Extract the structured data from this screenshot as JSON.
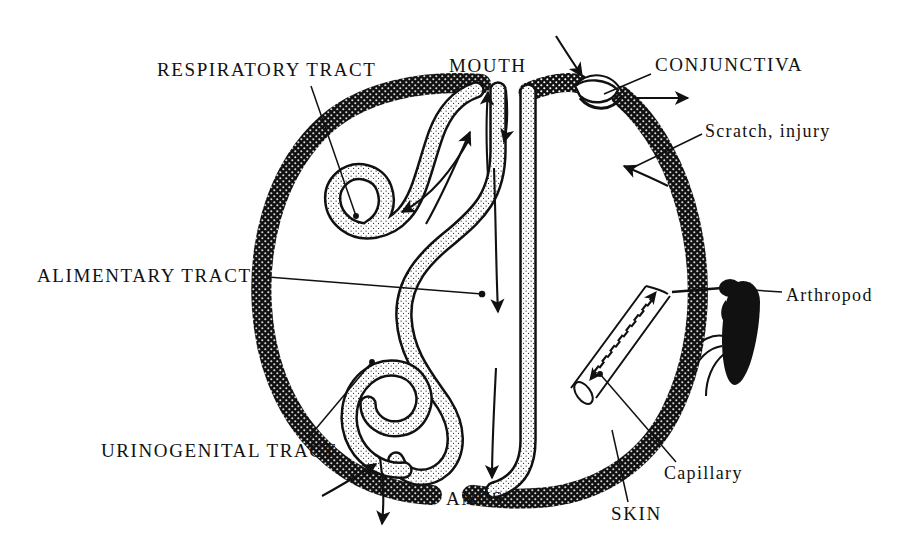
{
  "figure": {
    "kind": "anatomical-schematic",
    "background_color": "#ffffff",
    "ink_color": "#111111"
  },
  "labels": {
    "respiratory_tract": "RESPIRATORY TRACT",
    "mouth": "MOUTH",
    "conjunctiva": "CONJUNCTIVA",
    "scratch_injury": "Scratch, injury",
    "alimentary_tract": "ALIMENTARY TRACT",
    "arthropod": "Arthropod",
    "urinogenital_tract": "URINOGENITAL TRACT",
    "capillary": "Capillary",
    "anus": "ANUS",
    "skin": "SKIN"
  },
  "structures": [
    {
      "name": "skin-boundary",
      "style": "thick stippled black band forming closed body outline"
    },
    {
      "name": "respiratory-tract",
      "style": "stippled tube, upper left, looping inward from mouth"
    },
    {
      "name": "alimentary-tract",
      "style": "stippled tube running mouth to anus"
    },
    {
      "name": "urinogenital-tract",
      "style": "stippled tube, lower left, looping inward"
    },
    {
      "name": "conjunctiva",
      "style": "white crescent gap at top right of skin boundary"
    },
    {
      "name": "capillary",
      "style": "3D cylinder penetrating skin, dashed bidirectional flow"
    },
    {
      "name": "arthropod",
      "style": "solid black insect silhouette with proboscis and legs"
    }
  ],
  "flow_arrows": [
    {
      "name": "mouth-inward",
      "direction": "in"
    },
    {
      "name": "mouth-outward",
      "direction": "out"
    },
    {
      "name": "respiratory-inward",
      "direction": "in"
    },
    {
      "name": "alimentary-downward",
      "direction": "out"
    },
    {
      "name": "anus-outward",
      "direction": "out"
    },
    {
      "name": "urinogenital-inward",
      "direction": "in"
    },
    {
      "name": "urinogenital-outward",
      "direction": "out"
    },
    {
      "name": "conjunctiva-inward",
      "direction": "in"
    },
    {
      "name": "conjunctiva-outward",
      "direction": "out"
    },
    {
      "name": "scratch-inward",
      "direction": "in"
    },
    {
      "name": "capillary-inward",
      "direction": "in"
    },
    {
      "name": "capillary-outward",
      "direction": "out"
    }
  ]
}
